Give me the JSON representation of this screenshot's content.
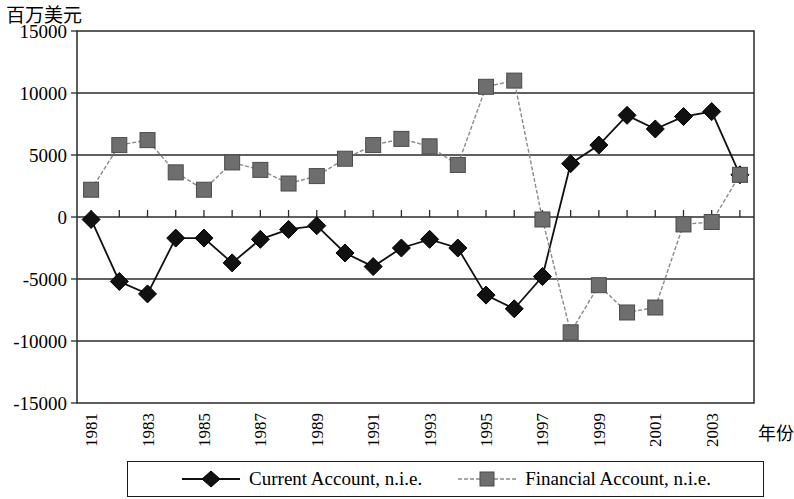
{
  "axis": {
    "y_title": "百万美元",
    "x_title": "年份",
    "y_ticks": [
      "15000",
      "10000",
      "5000",
      "0",
      "-5000",
      "-10000",
      "-15000"
    ],
    "x_ticks_visible": [
      "1981",
      "1983",
      "1985",
      "1987",
      "1989",
      "1991",
      "1993",
      "1995",
      "1997",
      "1999",
      "2001",
      "2003"
    ]
  },
  "legend": {
    "items": [
      {
        "label": "Current Account, n.i.e.",
        "marker": "diamond",
        "color": "#111111",
        "line": "solid"
      },
      {
        "label": "Financial Account, n.i.e.",
        "marker": "square",
        "color": "#6e6e6e",
        "line": "dashed"
      }
    ]
  },
  "chart_data": {
    "type": "line",
    "title": "",
    "subtitle": "",
    "xlabel": "年份",
    "ylabel": "百万美元",
    "ylim": [
      -15000,
      15000
    ],
    "ytick_step": 5000,
    "grid": true,
    "legend_position": "bottom",
    "x": [
      1981,
      1982,
      1983,
      1984,
      1985,
      1986,
      1987,
      1988,
      1989,
      1990,
      1991,
      1992,
      1993,
      1994,
      1995,
      1996,
      1997,
      1998,
      1999,
      2000,
      2001,
      2002,
      2003,
      2004
    ],
    "categories": [
      "1981",
      "1982",
      "1983",
      "1984",
      "1985",
      "1986",
      "1987",
      "1988",
      "1989",
      "1990",
      "1991",
      "1992",
      "1993",
      "1994",
      "1995",
      "1996",
      "1997",
      "1998",
      "1999",
      "2000",
      "2001",
      "2002",
      "2003",
      "2004"
    ],
    "series": [
      {
        "name": "Current Account, n.i.e.",
        "marker": "diamond",
        "color": "#111111",
        "line": "solid",
        "values": [
          -200,
          -5200,
          -6200,
          -1700,
          -1700,
          -3700,
          -1800,
          -1000,
          -700,
          -2900,
          -4000,
          -2500,
          -1800,
          -2500,
          -6300,
          -7400,
          -4800,
          4300,
          5800,
          8200,
          7100,
          8100,
          8500,
          3400
        ]
      },
      {
        "name": "Financial Account, n.i.e.",
        "marker": "square",
        "color": "#6e6e6e",
        "line": "dashed",
        "values": [
          2200,
          5800,
          6200,
          3600,
          2200,
          4400,
          3800,
          2700,
          3300,
          4700,
          5800,
          6300,
          5700,
          4200,
          10500,
          11000,
          -200,
          -9300,
          -5500,
          -7700,
          -7300,
          -600,
          -400,
          3400
        ]
      }
    ]
  }
}
